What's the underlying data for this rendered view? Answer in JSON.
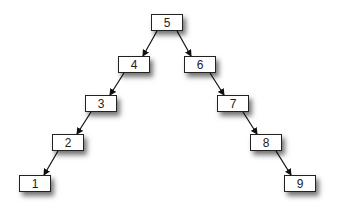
{
  "diagram": {
    "type": "binary-search-tree",
    "nodes": [
      {
        "id": "5",
        "label": "5",
        "x": 151,
        "y": 14
      },
      {
        "id": "4",
        "label": "4",
        "x": 118,
        "y": 56
      },
      {
        "id": "6",
        "label": "6",
        "x": 184,
        "y": 56
      },
      {
        "id": "3",
        "label": "3",
        "x": 85,
        "y": 95
      },
      {
        "id": "7",
        "label": "7",
        "x": 217,
        "y": 95
      },
      {
        "id": "2",
        "label": "2",
        "x": 52,
        "y": 134
      },
      {
        "id": "8",
        "label": "8",
        "x": 250,
        "y": 134
      },
      {
        "id": "1",
        "label": "1",
        "x": 19,
        "y": 175
      },
      {
        "id": "9",
        "label": "9",
        "x": 284,
        "y": 175
      }
    ],
    "edges": [
      {
        "from": "5",
        "to": "4"
      },
      {
        "from": "5",
        "to": "6"
      },
      {
        "from": "4",
        "to": "3"
      },
      {
        "from": "6",
        "to": "7"
      },
      {
        "from": "3",
        "to": "2"
      },
      {
        "from": "7",
        "to": "8"
      },
      {
        "from": "2",
        "to": "1"
      },
      {
        "from": "8",
        "to": "9"
      }
    ]
  }
}
